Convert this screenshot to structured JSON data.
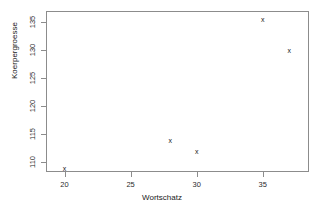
{
  "chart_data": {
    "type": "scatter",
    "title": "",
    "xlabel": "Wortschatz",
    "ylabel": "Koerpergroesse",
    "xlim": [
      18.6,
      38.5
    ],
    "ylim": [
      108.3,
      137.0
    ],
    "xticks": [
      20,
      25,
      30,
      35
    ],
    "yticks": [
      110,
      115,
      120,
      125,
      130,
      135
    ],
    "xticklabels": [
      "20",
      "25",
      "30",
      "35"
    ],
    "yticklabels": [
      "110",
      "115",
      "120",
      "125",
      "130",
      "135"
    ],
    "grid": false,
    "legend": null,
    "marker": "x",
    "points": [
      {
        "x": 20,
        "y": 109
      },
      {
        "x": 28,
        "y": 114
      },
      {
        "x": 30,
        "y": 112
      },
      {
        "x": 35,
        "y": 135.5
      },
      {
        "x": 37,
        "y": 130
      }
    ],
    "series": [
      {
        "name": "Koerpergroesse vs Wortschatz",
        "x": [
          20,
          28,
          30,
          35,
          37
        ],
        "y": [
          109,
          114,
          112,
          135.5,
          130
        ]
      }
    ],
    "colors": {
      "marker": "#1a1a1a",
      "frame": "#8c8c8c",
      "background": "#ffffff",
      "text": "#1a1a1a"
    }
  }
}
